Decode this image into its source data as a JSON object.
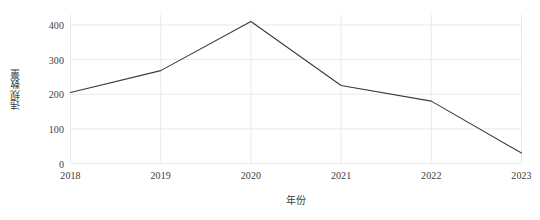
{
  "chart_data": {
    "type": "line",
    "title": "",
    "subtitle": "",
    "xlabel": "年份",
    "ylabel": "违规数量",
    "categories": [
      "2018",
      "2019",
      "2020",
      "2021",
      "2022",
      "2023"
    ],
    "x": [
      2018,
      2019,
      2020,
      2021,
      2022,
      2023
    ],
    "values": [
      205,
      268,
      410,
      225,
      180,
      30
    ],
    "series": [
      {
        "name": "违规数量",
        "values": [
          205,
          268,
          410,
          225,
          180,
          30
        ]
      }
    ],
    "xtick_labels": [
      "2018",
      "2019",
      "2020",
      "2021",
      "2022",
      "2023"
    ],
    "ytick_labels": [
      "0",
      "100",
      "200",
      "300",
      "400"
    ],
    "ytick_values": [
      0,
      100,
      200,
      300,
      400
    ],
    "xlim": [
      2018,
      2023
    ],
    "ylim": [
      0,
      430
    ],
    "grid": true,
    "legend": false,
    "legend_position": "none",
    "annotations": [],
    "line_color": "#3a3a3a",
    "grid_color": "#e8e8e8",
    "background_color": "#ffffff",
    "text_color": "#3c3c3c"
  }
}
